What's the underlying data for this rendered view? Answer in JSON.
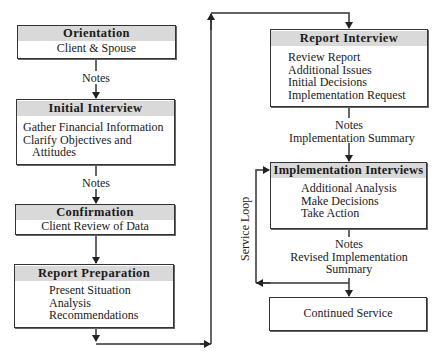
{
  "diagram": {
    "type": "flowchart",
    "nodes": [
      {
        "id": "orientation",
        "title": "Orientation",
        "lines": [
          "Client & Spouse"
        ]
      },
      {
        "id": "initial_interview",
        "title": "Initial Interview",
        "lines": [
          "Gather Financial Information",
          "Clarify Objectives and",
          "Attitudes"
        ]
      },
      {
        "id": "confirmation",
        "title": "Confirmation",
        "lines": [
          "Client Review of Data"
        ]
      },
      {
        "id": "report_preparation",
        "title": "Report Preparation",
        "lines": [
          "Present Situation",
          "Analysis",
          "Recommendations"
        ]
      },
      {
        "id": "report_interview",
        "title": "Report Interview",
        "lines": [
          "Review Report",
          "Additional Issues",
          "Initial Decisions",
          "Implementation Request"
        ]
      },
      {
        "id": "implementation_interviews",
        "title": "Implementation Interviews",
        "lines": [
          "Additional Analysis",
          "Make Decisions",
          "Take Action"
        ]
      },
      {
        "id": "continued_service",
        "title": "",
        "lines": [
          "Continued Service"
        ]
      }
    ],
    "edge_labels": {
      "orientation_to_initial": "Notes",
      "initial_to_confirmation": "Notes",
      "report_interview_to_impl": [
        "Notes",
        "Implementation Summary"
      ],
      "impl_to_continued": [
        "Notes",
        "Revised Implementation",
        "Summary"
      ],
      "service_loop": "Service Loop"
    },
    "edges": [
      [
        "orientation",
        "initial_interview"
      ],
      [
        "initial_interview",
        "confirmation"
      ],
      [
        "confirmation",
        "report_preparation"
      ],
      [
        "report_preparation",
        "report_interview"
      ],
      [
        "report_interview",
        "implementation_interviews"
      ],
      [
        "implementation_interviews",
        "continued_service"
      ],
      [
        "implementation_interviews",
        "implementation_interviews"
      ]
    ],
    "colors": {
      "header_fill": "#d9d9d9",
      "line": "#333333"
    }
  }
}
